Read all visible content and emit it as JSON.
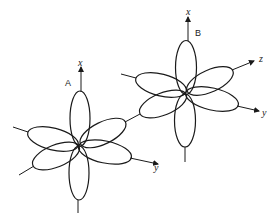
{
  "figure": {
    "colors": {
      "line": "#1a1a1a",
      "background": "#ffffff"
    }
  },
  "atoms": [
    {
      "label": "A",
      "axes": {
        "x": "x",
        "y": "y"
      }
    },
    {
      "label": "B",
      "axes": {
        "x": "x",
        "y": "y",
        "z": "z"
      }
    }
  ]
}
